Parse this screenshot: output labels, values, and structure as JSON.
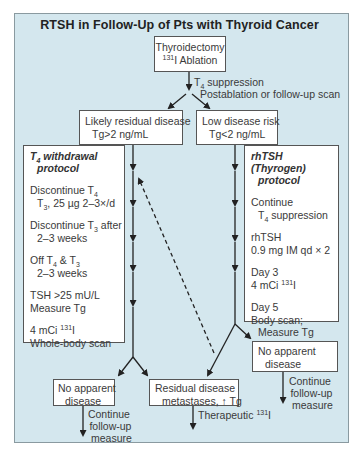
{
  "title": "RTSH in Follow-Up of Pts with Thyroid Cancer",
  "colors": {
    "background": "#d4e7ee",
    "box": "#ffffff",
    "line": "#222222"
  },
  "start_box": {
    "line1": "Thyroidectomy",
    "line2_sup": "131",
    "line2": "I Ablation"
  },
  "start_label": {
    "line1_pre": "T",
    "line1_sub": "4",
    "line1": " suppression",
    "line2": "Postablation or follow-up scan"
  },
  "branch_left": {
    "line1": "Likely residual disease",
    "line2": "Tg>2 ng/mL"
  },
  "branch_right": {
    "line1": "Low disease risk",
    "line2": "Tg<2 ng/mL"
  },
  "left_protocol": {
    "title_pre": "T",
    "title_sub": "4",
    "title": " withdrawal",
    "title2": "protocol",
    "steps": [
      {
        "l1_pre": "Discontinue T",
        "l1_sub": "4",
        "l2_pre": "T",
        "l2_sub": "3",
        "l2": ", 25 µg 2–3×/d"
      },
      {
        "l1_pre": "Discontinue T",
        "l1_sub": "3",
        "l1_post": " after",
        "l2": "2–3 weeks"
      },
      {
        "l1_pre": "Off T",
        "l1_sub": "4",
        "l1_mid": " & T",
        "l1_sub2": "3",
        "l2": "2–3 weeks"
      },
      {
        "l1": "TSH >25 mU/L",
        "l2": "Measure Tg"
      },
      {
        "l1_pre": "4 mCi ",
        "l1_sup": "131",
        "l1_post": "I",
        "l2": "Whole-body scan"
      }
    ]
  },
  "right_protocol": {
    "title": "rhTSH (Thyrogen)",
    "title2": "protocol",
    "steps": [
      {
        "l1": "Continue",
        "l2_pre": "T",
        "l2_sub": "4",
        "l2": " suppression"
      },
      {
        "l1": "rhTSH",
        "l2": "0.9 mg IM qd × 2"
      },
      {
        "l1": "Day 3",
        "l2_pre": "4 mCi ",
        "l2_sup": "131",
        "l2": "I"
      },
      {
        "l1": "Day 5",
        "l2": "Body scan;",
        "l3": "Measure Tg"
      }
    ]
  },
  "outcome_left": {
    "line1": "No apparent",
    "line2": "disease"
  },
  "outcome_residual": {
    "line1": "Residual disease",
    "line2": "metastases, ↑ Tg"
  },
  "outcome_right": {
    "line1": "No apparent",
    "line2": "disease"
  },
  "continue_left": {
    "line1": "Continue",
    "line2": "follow-up",
    "line3": "measure"
  },
  "continue_right": {
    "line1": "Continue",
    "line2": "follow-up",
    "line3": "measure"
  },
  "therapeutic": {
    "text": "Therapeutic ",
    "sup": "131",
    "post": "I"
  }
}
